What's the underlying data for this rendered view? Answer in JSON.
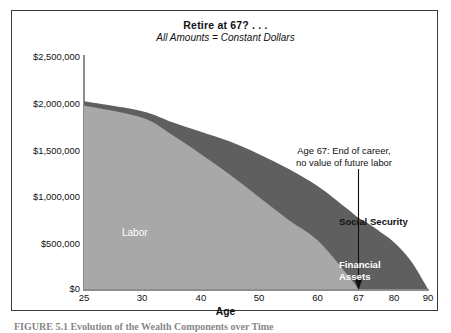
{
  "figure": {
    "title": "Retire at 67? . . .",
    "subtitle": "All Amounts = Constant Dollars",
    "caption": "FIGURE 5.1    Evolution of the Wealth Components over Time"
  },
  "chart_data": {
    "type": "area",
    "title": "Retire at 67? . . .",
    "subtitle": "All Amounts = Constant Dollars",
    "xlabel": "Age",
    "ylabel": "",
    "stacked": true,
    "grid": false,
    "legend": "in-plot labels",
    "xlim": [
      25,
      90
    ],
    "ylim": [
      0,
      2500000
    ],
    "x_ticks": [
      25,
      30,
      40,
      50,
      60,
      67,
      80,
      90
    ],
    "x_tick_labels": [
      "25",
      "30",
      "40",
      "50",
      "60",
      "67",
      "80",
      "90"
    ],
    "x_tick_positions_pct": [
      0,
      16.9,
      34.0,
      50.9,
      67.9,
      79.8,
      90.1,
      100
    ],
    "y_ticks": [
      0,
      500000,
      1000000,
      1500000,
      2000000,
      2500000
    ],
    "y_tick_labels": [
      "$0",
      "$500,000",
      "$1,000,000",
      "$1,500,000",
      "$2,000,000",
      "$2,500,000"
    ],
    "x": [
      25,
      30,
      35,
      40,
      45,
      50,
      55,
      60,
      65,
      67,
      70,
      75,
      80,
      85,
      90
    ],
    "series": [
      {
        "name": "Labor",
        "color": "#a8a8a8",
        "values": [
          1960000,
          1830000,
          1650000,
          1440000,
          1220000,
          980000,
          740000,
          520000,
          160000,
          0,
          0,
          0,
          0,
          0,
          0
        ]
      },
      {
        "name": "Financial Assets",
        "color": "#5f5f5f",
        "values": [
          0,
          10000,
          60000,
          150000,
          250000,
          340000,
          410000,
          430000,
          540000,
          600000,
          560000,
          480000,
          390000,
          230000,
          0
        ]
      },
      {
        "name": "Social Security",
        "color": "#5f5f5f",
        "values": [
          45000,
          60000,
          75000,
          90000,
          105000,
          120000,
          135000,
          150000,
          160000,
          160000,
          150000,
          130000,
          110000,
          70000,
          0
        ]
      }
    ],
    "total_wealth": [
      2005000,
      1900000,
      1785000,
      1680000,
      1575000,
      1440000,
      1285000,
      1100000,
      860000,
      760000,
      710000,
      610000,
      500000,
      300000,
      0
    ],
    "annotation": {
      "line1": "Age 67: End of career,",
      "line2": "no value of future labor",
      "points_to_age": 67,
      "arrow": "down"
    },
    "area_labels": [
      {
        "text": "Labor",
        "color": "#ffffff",
        "bold": false
      },
      {
        "text": "Social Security",
        "color": "#111111",
        "bold": true
      },
      {
        "text": "Financial",
        "color": "#ffffff",
        "bold": true
      },
      {
        "text": "Assets",
        "color": "#ffffff",
        "bold": true
      }
    ]
  },
  "colors": {
    "labor_fill": "#a8a8a8",
    "dark_fill": "#5f5f5f",
    "frame": "#3a3a3a",
    "axis": "#8c8c8c",
    "background": "#ffffff",
    "text": "#111111"
  }
}
